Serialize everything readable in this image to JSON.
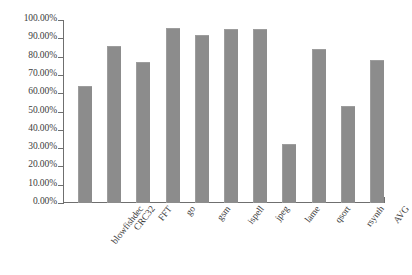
{
  "chart_data": {
    "type": "bar",
    "title": "",
    "subtitle": "",
    "xlabel": "",
    "ylabel": "",
    "categories": [
      "blowfishdec",
      "CRC32",
      "FFT",
      "go",
      "gsm",
      "ispell",
      "jpeg",
      "lame",
      "qsort",
      "rsynth",
      "AVG"
    ],
    "values": [
      64.0,
      86.0,
      77.0,
      95.5,
      92.0,
      95.0,
      95.0,
      32.0,
      84.0,
      53.0,
      78.0
    ],
    "value_labels": [
      "64.00%",
      "86.00%",
      "77.00%",
      "95.50%",
      "92.00%",
      "95.00%",
      "95.00%",
      "32.00%",
      "84.00%",
      "53.00%",
      "78.00%"
    ],
    "ylim": [
      0,
      100
    ],
    "ytick_values": [
      0,
      10,
      20,
      30,
      40,
      50,
      60,
      70,
      80,
      90,
      100
    ],
    "ytick_labels": [
      "0.00%",
      "10.00%",
      "20.00%",
      "30.00%",
      "40.00%",
      "50.00%",
      "60.00%",
      "70.00%",
      "80.00%",
      "90.00%",
      "100.00%"
    ],
    "grid": false,
    "legend": null,
    "legend_position": "none",
    "bar_color": "#8c8c8c",
    "axis_color": "#6f6f6f",
    "background_color": "#ffffff",
    "text_color": "#3c3c3c"
  }
}
